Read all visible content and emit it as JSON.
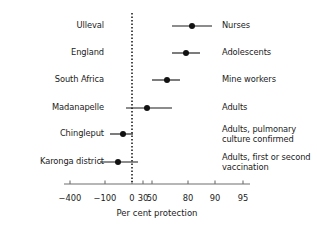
{
  "figure": {
    "axis_title": "Per cent protection",
    "reference_value": 0
  },
  "chart_data": {
    "type": "scatter",
    "title": "",
    "subtitle": "",
    "xlabel": "Per cent protection",
    "ylabel": "",
    "grid": false,
    "legend": "none",
    "orientation": "horizontal-forest",
    "xlim": [
      -400,
      95
    ],
    "xticks": [
      -400,
      -100,
      0,
      30,
      50,
      80,
      90,
      95
    ],
    "xticklabels": [
      "−400",
      "−100",
      "0",
      "30",
      "50",
      "80",
      "90",
      "95"
    ],
    "tick_pixel_x": [
      70,
      105,
      132,
      143,
      152,
      188,
      215,
      243
    ],
    "reference_line": {
      "x": 0,
      "style": "dotted"
    },
    "categories": [
      "Ulleval",
      "England",
      "South Africa",
      "Madanapelle",
      "Chingleput",
      "Karonga district"
    ],
    "group_labels": [
      "Nurses",
      "Adolescents",
      "Mine workers",
      "Adults",
      "Adults, pulmonary culture confirmed",
      "Adults, first or second vaccination"
    ],
    "points": [
      {
        "study": "Ulleval",
        "group": "Nurses",
        "estimate": 81,
        "ci_low": 70,
        "ci_high": 88,
        "px_center": 192,
        "px_low": 172,
        "px_high": 212,
        "px_y": 26
      },
      {
        "study": "England",
        "group": "Adolescents",
        "estimate": 78,
        "ci_low": 70,
        "ci_high": 84,
        "px_center": 186,
        "px_low": 172,
        "px_high": 200,
        "px_y": 53
      },
      {
        "study": "South Africa",
        "group": "Mine workers",
        "estimate": 60,
        "ci_low": 50,
        "ci_high": 68,
        "px_center": 167,
        "px_low": 152,
        "px_high": 180,
        "px_y": 80
      },
      {
        "study": "Madanapelle",
        "group": "Adults",
        "estimate": 38,
        "ci_low": -10,
        "ci_high": 65,
        "px_center": 147,
        "px_low": 126,
        "px_high": 172,
        "px_y": 108
      },
      {
        "study": "Chingleput",
        "group": "Adults, pulmonary culture confirmed",
        "estimate": -18,
        "ci_low": -60,
        "ci_high": 5,
        "px_center": 123,
        "px_low": 110,
        "px_high": 133,
        "px_y": 134
      },
      {
        "study": "Karonga district",
        "group": "Adults, first or second vaccination",
        "estimate": -22,
        "ci_low": -120,
        "ci_high": 8,
        "px_center": 118,
        "px_low": 100,
        "px_high": 138,
        "px_y": 162
      }
    ]
  },
  "colors": {
    "marker": "#121212",
    "ci_line": "#1b1b1b",
    "axis": "#6f6f6f",
    "reference_line": "#101010",
    "text": "#1b1b1b",
    "background": "#ffffff"
  },
  "geometry": {
    "axis_y": 184,
    "axis_x_start": 64,
    "axis_x_end": 250,
    "ref_line_x": 132,
    "ref_line_y_top": 13,
    "ref_line_y_bottom": 182,
    "study_label_right_x": 104,
    "group_label_left_x": 222,
    "tick_label_y": 193,
    "axis_title_x": 157,
    "axis_title_y": 208
  }
}
